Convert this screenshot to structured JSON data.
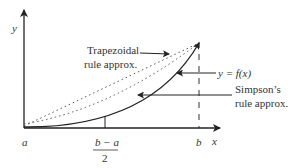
{
  "diagram": {
    "axes": {
      "y_label": "y",
      "x_label": "x"
    },
    "ticks": {
      "a": "a",
      "b": "b",
      "mid_numerator": "b − a",
      "mid_denominator": "2"
    },
    "annotations": {
      "trapezoidal_line1": "Trapezoidal",
      "trapezoidal_line2": "rule approx.",
      "function_label": "y = f(x)",
      "simpson_line1": "Simpson’s",
      "simpson_line2": "rule approx."
    },
    "colors": {
      "ink": "#333333",
      "curve": "#222222",
      "dotted": "#555555",
      "background": "#ffffff"
    }
  }
}
